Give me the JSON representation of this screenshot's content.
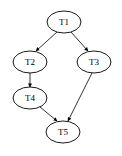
{
  "diagram": {
    "type": "directed-graph",
    "nodes": [
      {
        "id": "T1",
        "label": "T1",
        "cx": 64,
        "cy": 22
      },
      {
        "id": "T2",
        "label": "T2",
        "cx": 30,
        "cy": 62
      },
      {
        "id": "T3",
        "label": "T3",
        "cx": 94,
        "cy": 62
      },
      {
        "id": "T4",
        "label": "T4",
        "cx": 30,
        "cy": 98
      },
      {
        "id": "T5",
        "label": "T5",
        "cx": 63,
        "cy": 132
      }
    ],
    "edges": [
      {
        "from": "T1",
        "to": "T2"
      },
      {
        "from": "T1",
        "to": "T3"
      },
      {
        "from": "T2",
        "to": "T4"
      },
      {
        "from": "T4",
        "to": "T5"
      },
      {
        "from": "T3",
        "to": "T5"
      }
    ]
  }
}
